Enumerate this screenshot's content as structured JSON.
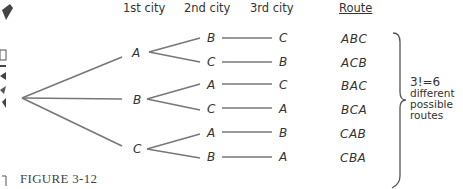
{
  "headers": {
    "first": "1st city",
    "second": "2nd city",
    "third": "3rd city",
    "route": "Route"
  },
  "tree": {
    "level1": [
      "A",
      "B",
      "C"
    ],
    "level2": [
      "B",
      "C",
      "A",
      "C",
      "A",
      "B"
    ],
    "level3": [
      "C",
      "B",
      "C",
      "A",
      "B",
      "A"
    ]
  },
  "routes": [
    "ABC",
    "ACB",
    "BAC",
    "BCA",
    "CAB",
    "CBA"
  ],
  "note": {
    "equation": "3!=6",
    "line1": "different",
    "line2": "possible",
    "line3": "routes"
  },
  "caption": "FIGURE 3-12",
  "colors": {
    "line": "#777777",
    "text": "#333333"
  }
}
